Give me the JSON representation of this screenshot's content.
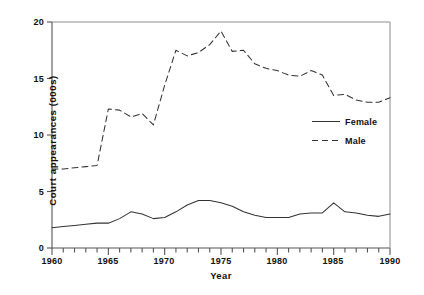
{
  "chart_data": {
    "type": "line",
    "title": "",
    "xlabel": "Year",
    "ylabel": "Court appearances (000s)",
    "xlim": [
      1960,
      1990
    ],
    "ylim": [
      0,
      20
    ],
    "xticks_major": [
      1960,
      1965,
      1970,
      1975,
      1980,
      1985,
      1990
    ],
    "xticks_minor_step": 1,
    "yticks": [
      0,
      5,
      10,
      15,
      20
    ],
    "grid": false,
    "legend_position": "center-right",
    "x": [
      1960,
      1961,
      1962,
      1963,
      1964,
      1965,
      1966,
      1967,
      1968,
      1969,
      1970,
      1971,
      1972,
      1973,
      1974,
      1975,
      1976,
      1977,
      1978,
      1979,
      1980,
      1981,
      1982,
      1983,
      1984,
      1985,
      1986,
      1987,
      1988,
      1989,
      1990
    ],
    "series": [
      {
        "name": "Female",
        "style": "solid",
        "color": "#333333",
        "values": [
          1.8,
          1.9,
          2.0,
          2.1,
          2.2,
          2.2,
          2.6,
          3.2,
          3.0,
          2.6,
          2.7,
          3.2,
          3.8,
          4.2,
          4.2,
          4.0,
          3.7,
          3.2,
          2.9,
          2.7,
          2.7,
          2.7,
          3.0,
          3.1,
          3.1,
          4.0,
          3.2,
          3.1,
          2.9,
          2.8,
          3.0
        ]
      },
      {
        "name": "Male",
        "style": "dashed",
        "color": "#333333",
        "values": [
          7.0,
          7.0,
          7.1,
          7.2,
          7.3,
          12.3,
          12.2,
          11.6,
          11.9,
          10.9,
          14.4,
          17.5,
          17.0,
          17.3,
          18.0,
          19.2,
          17.4,
          17.5,
          16.3,
          15.9,
          15.7,
          15.3,
          15.2,
          15.7,
          15.3,
          13.5,
          13.6,
          13.1,
          12.9,
          12.9,
          13.3
        ]
      }
    ]
  },
  "axes": {
    "ytick_labels": [
      "0",
      "5",
      "10",
      "15",
      "20"
    ],
    "xtick_labels": [
      "1960",
      "1965",
      "1970",
      "1975",
      "1980",
      "1985",
      "1990"
    ],
    "ylabel_text": "Court appearances (000s)",
    "xlabel_text": "Year"
  },
  "legend": {
    "entries": [
      {
        "label": "Female",
        "style": "solid"
      },
      {
        "label": "Male",
        "style": "dashed"
      }
    ]
  }
}
